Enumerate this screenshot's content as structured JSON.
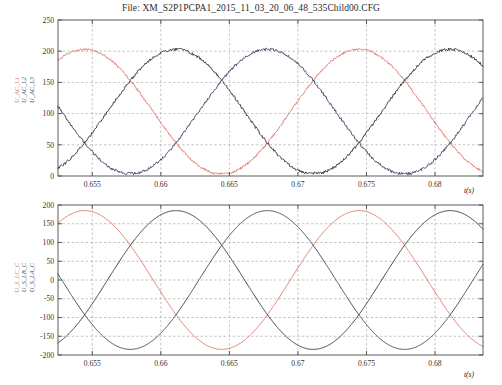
{
  "figure": {
    "title": "File: XM_S2P1PCPA1_2015_11_03_20_06_48_535Child00.CFG",
    "background": "#ffffff",
    "width": 502,
    "height": 385
  },
  "colors": {
    "series_red": "#e0776b",
    "series_navy": "#3d4a66",
    "series_dark": "#3a3a3a",
    "axis": "#4a4a4a",
    "grid": "#8c8c8c"
  },
  "chart_data": [
    {
      "type": "line",
      "id": "upper-plot",
      "title": "",
      "xlabel": "t(s)",
      "ylabel": "U_AC_L1 U_AC_L2 U_AC_L3",
      "xlim": [
        0.6525,
        0.6835
      ],
      "ylim": [
        0,
        250
      ],
      "xticks": [
        0.655,
        0.66,
        0.665,
        0.67,
        0.675,
        0.68
      ],
      "xticklabels": [
        "0.655",
        "0.66",
        "0.665",
        "0.67",
        "0.675",
        "0.68"
      ],
      "yticks": [
        0,
        50,
        100,
        150,
        200,
        250
      ],
      "yticklabels": [
        "0",
        "50",
        "100",
        "150",
        "200",
        "250"
      ],
      "grid": true,
      "legend": "rotated-y-axis-labels",
      "series": [
        {
          "name": "U_AC_L1",
          "color": "#e0776b",
          "waveform": "rectified-sine",
          "amplitude": 100,
          "offset": 103,
          "period": 0.02,
          "phase_deg": 100,
          "noise": 1.5,
          "min": 4,
          "max": 203
        },
        {
          "name": "U_AC_L2",
          "color": "#3d4a66",
          "waveform": "rectified-sine",
          "amplitude": 100,
          "offset": 103,
          "period": 0.02,
          "phase_deg": 220,
          "noise": 2.0,
          "min": 4,
          "max": 205
        },
        {
          "name": "U_AC_L3",
          "color": "#3a3a3a",
          "waveform": "rectified-sine",
          "amplitude": 100,
          "offset": 103,
          "period": 0.02,
          "phase_deg": 340,
          "noise": 2.0,
          "min": 5,
          "max": 202
        }
      ]
    },
    {
      "type": "line",
      "id": "lower-plot",
      "title": "",
      "xlabel": "t(s)",
      "ylabel": "U_S_LC_C U_S_LB_C U_S_LA_C",
      "xlim": [
        0.6525,
        0.6835
      ],
      "ylim": [
        -200,
        200
      ],
      "xticks": [
        0.655,
        0.66,
        0.665,
        0.67,
        0.675,
        0.68
      ],
      "xticklabels": [
        "0.655",
        "0.66",
        "0.665",
        "0.67",
        "0.675",
        "0.68"
      ],
      "yticks": [
        -200,
        -150,
        -100,
        -50,
        0,
        50,
        100,
        150,
        200
      ],
      "yticklabels": [
        "-200",
        "-150",
        "-100",
        "-50",
        "0",
        "50",
        "100",
        "150",
        "200"
      ],
      "grid": true,
      "legend": "rotated-y-axis-labels",
      "series": [
        {
          "name": "U_S_LA_C",
          "color": "#e0776b",
          "waveform": "sine",
          "amplitude": 185,
          "offset": 0,
          "period": 0.02,
          "phase_deg": 190,
          "noise": 0,
          "min": -185,
          "max": 185
        },
        {
          "name": "U_S_LB_C",
          "color": "#3d4a66",
          "waveform": "sine",
          "amplitude": 185,
          "offset": 0,
          "period": 0.02,
          "phase_deg": 310,
          "noise": 0,
          "min": -185,
          "max": 185
        },
        {
          "name": "U_S_LC_C",
          "color": "#3a3a3a",
          "waveform": "sine",
          "amplitude": 185,
          "offset": 0,
          "period": 0.02,
          "phase_deg": 70,
          "noise": 0,
          "min": -185,
          "max": 185
        }
      ]
    }
  ],
  "upper": {
    "ylabels": [
      "U_AC_L1",
      "U_AC_L2",
      "U_AC_L3"
    ],
    "xlabel": "t(s)"
  },
  "lower": {
    "ylabels": [
      "U_S_LC_C",
      "U_S_LB_C",
      "U_S_LA_C"
    ],
    "xlabel": "t(s)"
  }
}
